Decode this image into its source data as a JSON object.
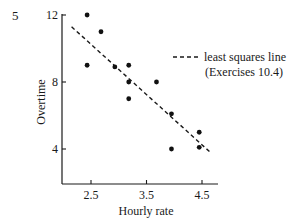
{
  "figure": {
    "panel_label": "5"
  },
  "chart_data": {
    "type": "scatter",
    "title": "",
    "xlabel": "Hourly rate",
    "ylabel": "Overtime",
    "xlim": [
      2.0,
      4.8
    ],
    "ylim": [
      2.0,
      12.0
    ],
    "x_ticks": [
      2.5,
      3.5,
      4.5
    ],
    "x_tick_labels": [
      "2.5",
      "3.5",
      "4.5"
    ],
    "y_ticks": [
      4,
      8,
      12
    ],
    "y_tick_labels": [
      "4",
      "8",
      "12"
    ],
    "grid": false,
    "series": [
      {
        "name": "observations",
        "type": "scatter",
        "points": [
          {
            "x": 2.43,
            "y": 12.0
          },
          {
            "x": 2.68,
            "y": 11.0
          },
          {
            "x": 2.43,
            "y": 9.0
          },
          {
            "x": 2.93,
            "y": 8.9
          },
          {
            "x": 3.18,
            "y": 9.0
          },
          {
            "x": 3.18,
            "y": 8.0
          },
          {
            "x": 3.68,
            "y": 8.0
          },
          {
            "x": 3.18,
            "y": 7.0
          },
          {
            "x": 3.95,
            "y": 6.1
          },
          {
            "x": 4.45,
            "y": 5.0
          },
          {
            "x": 3.95,
            "y": 4.0
          },
          {
            "x": 4.45,
            "y": 4.1
          }
        ]
      },
      {
        "name": "least squares line",
        "type": "line",
        "style": "dashed",
        "points": [
          {
            "x": 2.15,
            "y": 11.3
          },
          {
            "x": 4.65,
            "y": 3.8
          }
        ]
      }
    ],
    "legend": {
      "position": "right",
      "entries": [
        {
          "label_line1": "least squares line",
          "label_line2": "(Exercises 10.4)",
          "style": "dashed"
        }
      ]
    }
  }
}
